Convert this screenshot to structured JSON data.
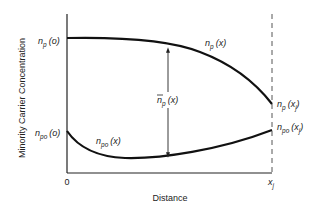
{
  "diagram": {
    "ylabel": "Minority Carrier Concentration",
    "xlabel": "Distance",
    "x_ticks": {
      "origin": "0",
      "junction_main": "x",
      "junction_sub": "j"
    },
    "curves": {
      "np": {
        "start_label_main": "n",
        "start_label_sub": "p",
        "start_label_arg": "(o)",
        "mid_label_main": "n",
        "mid_label_sub": "p",
        "mid_label_arg": "(x)",
        "end_label_main": "n",
        "end_label_sub": "p",
        "end_label_arg_open": "(x",
        "end_label_arg_sub": "j",
        "end_label_arg_close": ")"
      },
      "npo": {
        "start_label_main": "n",
        "start_label_sub": "po",
        "start_label_arg": "(o)",
        "mid_label_main": "n",
        "mid_label_sub": "po",
        "mid_label_arg": "(x)",
        "end_label_main": "n",
        "end_label_sub": "po",
        "end_label_arg_open": "(x",
        "end_label_arg_sub": "j",
        "end_label_arg_close": ")"
      }
    },
    "excess": {
      "label_main": "n",
      "label_bar": "‾",
      "label_sub": "p",
      "label_arg": "(x)"
    }
  }
}
